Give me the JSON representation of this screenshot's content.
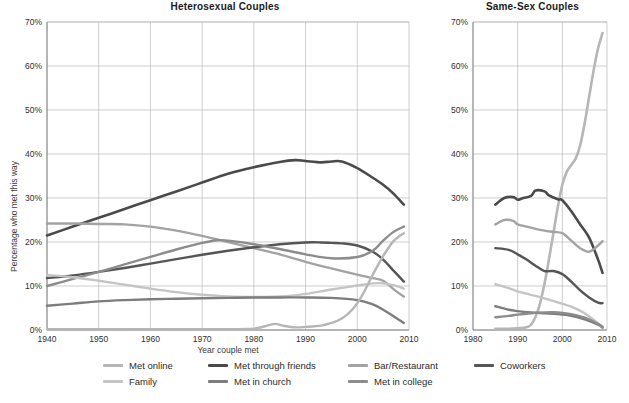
{
  "figure": {
    "x_axis_title": "Year couple met",
    "y_axis_title": "Percentage who met this way"
  },
  "panels": {
    "heterosexual": {
      "title": "Heterosexual Couples"
    },
    "same_sex": {
      "title": "Same-Sex Couples"
    }
  },
  "legend": {
    "rows": [
      [
        {
          "label": "Met online",
          "color": "#b6b6b6",
          "key": "met_online"
        },
        {
          "label": "Met through friends",
          "color": "#4a4a4a",
          "key": "met_through_friends"
        },
        {
          "label": "Bar/Restaurant",
          "color": "#a3a3a3",
          "key": "bar_restaurant"
        },
        {
          "label": "Coworkers",
          "color": "#555555",
          "key": "coworkers"
        }
      ],
      [
        {
          "label": "Family",
          "color": "#c4c4c4",
          "key": "family"
        },
        {
          "label": "Met in church",
          "color": "#7d7d7d",
          "key": "met_in_church"
        },
        {
          "label": "Met in college",
          "color": "#8c8c8c",
          "key": "met_in_college"
        }
      ]
    ]
  },
  "chart_data": [
    {
      "id": "heterosexual",
      "type": "line",
      "title": "Heterosexual Couples",
      "xlabel": "Year couple met",
      "ylabel": "Percentage who met this way",
      "xlim": [
        1940,
        2010
      ],
      "ylim": [
        0,
        70
      ],
      "xticks": [
        1940,
        1950,
        1960,
        1970,
        1980,
        1990,
        2000,
        2010
      ],
      "xticklabels": [
        "1940",
        "1950",
        "1960",
        "1970",
        "1980",
        "1990",
        "2000",
        "2010"
      ],
      "yticks": [
        0,
        10,
        20,
        30,
        40,
        50,
        60,
        70
      ],
      "yticklabels": [
        "0%",
        "10%",
        "20%",
        "30%",
        "40%",
        "50%",
        "60%",
        "70%"
      ],
      "grid": true,
      "legend_position": "below-figure",
      "series": [
        {
          "name": "Met through friends",
          "color": "#4a4a4a",
          "width": 2.6,
          "x": [
            1940,
            1945,
            1950,
            1955,
            1960,
            1965,
            1970,
            1975,
            1980,
            1985,
            1988,
            1990,
            1993,
            1995,
            1997,
            2000,
            2003,
            2005,
            2007,
            2009
          ],
          "y": [
            21.5,
            23.5,
            25.5,
            27.5,
            29.5,
            31.5,
            33.5,
            35.5,
            37.0,
            38.2,
            38.6,
            38.4,
            38.1,
            38.3,
            38.3,
            36.8,
            34.6,
            33.0,
            31.0,
            28.5
          ]
        },
        {
          "name": "Bar/Restaurant",
          "color": "#a3a3a3",
          "width": 2.4,
          "x": [
            1940,
            1945,
            1950,
            1955,
            1960,
            1965,
            1970,
            1975,
            1980,
            1985,
            1990,
            1995,
            2000,
            2003,
            2005,
            2007,
            2009
          ],
          "y": [
            24.2,
            24.2,
            24.1,
            24.0,
            23.5,
            22.6,
            21.4,
            20.0,
            18.6,
            17.2,
            15.5,
            14.0,
            12.6,
            11.8,
            11.2,
            9.3,
            7.6
          ]
        },
        {
          "name": "Coworkers",
          "color": "#555555",
          "width": 2.4,
          "x": [
            1940,
            1945,
            1950,
            1955,
            1960,
            1965,
            1970,
            1975,
            1980,
            1985,
            1990,
            1993,
            1995,
            1997,
            2000,
            2003,
            2005,
            2007,
            2009
          ],
          "y": [
            11.8,
            12.4,
            13.2,
            14.1,
            15.1,
            16.1,
            17.1,
            18.0,
            18.8,
            19.5,
            19.9,
            19.9,
            19.8,
            19.7,
            19.2,
            17.8,
            16.0,
            13.5,
            11.0
          ]
        },
        {
          "name": "Met in college",
          "color": "#8c8c8c",
          "width": 2.4,
          "x": [
            1940,
            1945,
            1950,
            1955,
            1960,
            1965,
            1970,
            1973,
            1975,
            1980,
            1985,
            1990,
            1995,
            2000,
            2003,
            2005,
            2007,
            2009
          ],
          "y": [
            10.0,
            11.6,
            13.2,
            14.9,
            16.6,
            18.3,
            19.8,
            20.4,
            20.3,
            19.5,
            18.4,
            17.2,
            16.3,
            16.6,
            18.0,
            20.3,
            22.3,
            23.5
          ]
        },
        {
          "name": "Family",
          "color": "#c4c4c4",
          "width": 2.4,
          "x": [
            1940,
            1945,
            1950,
            1955,
            1960,
            1965,
            1970,
            1975,
            1980,
            1985,
            1990,
            1995,
            2000,
            2003,
            2005,
            2007,
            2009
          ],
          "y": [
            12.5,
            12.0,
            11.2,
            10.3,
            9.4,
            8.6,
            8.0,
            7.6,
            7.5,
            7.6,
            8.2,
            9.2,
            10.1,
            10.6,
            10.6,
            10.2,
            9.4
          ]
        },
        {
          "name": "Met in church",
          "color": "#7d7d7d",
          "width": 2.4,
          "x": [
            1940,
            1945,
            1950,
            1955,
            1960,
            1965,
            1970,
            1975,
            1980,
            1985,
            1990,
            1995,
            2000,
            2003,
            2005,
            2007,
            2009
          ],
          "y": [
            5.5,
            6.0,
            6.5,
            6.8,
            7.0,
            7.1,
            7.2,
            7.3,
            7.4,
            7.4,
            7.4,
            7.3,
            6.8,
            5.8,
            4.6,
            3.1,
            1.6
          ]
        },
        {
          "name": "Met online",
          "color": "#b6b6b6",
          "width": 2.4,
          "x": [
            1940,
            1960,
            1975,
            1980,
            1982,
            1984,
            1986,
            1988,
            1990,
            1993,
            1995,
            1997,
            1999,
            2001,
            2003,
            2005,
            2007,
            2009
          ],
          "y": [
            0.2,
            0.2,
            0.2,
            0.3,
            0.8,
            1.4,
            0.9,
            0.6,
            0.7,
            1.0,
            1.6,
            2.6,
            4.6,
            8.0,
            12.6,
            16.8,
            20.2,
            22.0
          ]
        }
      ]
    },
    {
      "id": "same_sex",
      "type": "line",
      "title": "Same-Sex Couples",
      "xlabel": "Year couple met",
      "ylabel": "Percentage who met this way",
      "xlim": [
        1980,
        2010
      ],
      "ylim": [
        0,
        70
      ],
      "xticks": [
        1980,
        1990,
        2000,
        2010
      ],
      "xticklabels": [
        "1980",
        "1990",
        "2000",
        "2010"
      ],
      "yticks": [
        0,
        10,
        20,
        30,
        40,
        50,
        60,
        70
      ],
      "yticklabels": [
        "0%",
        "10%",
        "20%",
        "30%",
        "40%",
        "50%",
        "60%",
        "70%"
      ],
      "grid": true,
      "legend_position": "below-figure",
      "series": [
        {
          "name": "Met online",
          "color": "#b6b6b6",
          "width": 2.6,
          "x": [
            1985,
            1988,
            1990,
            1992,
            1993,
            1994,
            1995,
            1996,
            1997,
            1998,
            1999,
            2000,
            2001,
            2002,
            2003,
            2004,
            2005,
            2006,
            2007,
            2008,
            2009
          ],
          "y": [
            0.3,
            0.3,
            0.4,
            0.6,
            1.2,
            3.0,
            6.0,
            10.5,
            16.0,
            22.0,
            28.0,
            33.0,
            36.0,
            37.5,
            39.0,
            42.0,
            47.0,
            53.0,
            59.0,
            64.0,
            67.5
          ]
        },
        {
          "name": "Met through friends",
          "color": "#4a4a4a",
          "width": 2.6,
          "x": [
            1985,
            1987,
            1989,
            1990,
            1991,
            1993,
            1994,
            1996,
            1997,
            1999,
            2000,
            2002,
            2004,
            2006,
            2008,
            2009
          ],
          "y": [
            28.5,
            30.0,
            30.2,
            29.6,
            29.9,
            30.5,
            31.7,
            31.5,
            30.6,
            29.7,
            29.5,
            27.0,
            24.0,
            21.0,
            16.0,
            13.0
          ]
        },
        {
          "name": "Bar/Restaurant",
          "color": "#a3a3a3",
          "width": 2.4,
          "x": [
            1985,
            1987,
            1989,
            1990,
            1992,
            1994,
            1996,
            1998,
            2000,
            2002,
            2004,
            2006,
            2008,
            2009
          ],
          "y": [
            24.0,
            25.0,
            24.8,
            24.0,
            23.5,
            23.0,
            22.6,
            22.3,
            22.0,
            20.3,
            18.6,
            17.8,
            19.2,
            20.2
          ]
        },
        {
          "name": "Coworkers",
          "color": "#555555",
          "width": 2.4,
          "x": [
            1985,
            1988,
            1990,
            1992,
            1994,
            1996,
            1998,
            2000,
            2002,
            2004,
            2006,
            2008,
            2009
          ],
          "y": [
            18.6,
            18.2,
            17.2,
            16.0,
            14.6,
            13.4,
            13.4,
            12.7,
            11.0,
            9.0,
            7.4,
            6.2,
            6.1
          ]
        },
        {
          "name": "Family",
          "color": "#c4c4c4",
          "width": 2.4,
          "x": [
            1985,
            1988,
            1990,
            1993,
            1996,
            1999,
            2002,
            2005,
            2008,
            2009
          ],
          "y": [
            10.4,
            9.5,
            8.8,
            8.0,
            7.2,
            6.3,
            5.3,
            3.8,
            1.5,
            0.8
          ]
        },
        {
          "name": "Met in church",
          "color": "#7d7d7d",
          "width": 2.4,
          "x": [
            1985,
            1988,
            1990,
            1993,
            1996,
            1999,
            2002,
            2005,
            2008,
            2009
          ],
          "y": [
            5.4,
            4.6,
            4.3,
            4.0,
            3.8,
            3.6,
            3.2,
            2.4,
            1.2,
            0.6
          ]
        },
        {
          "name": "Met in college",
          "color": "#8c8c8c",
          "width": 2.4,
          "x": [
            1985,
            1988,
            1990,
            1993,
            1996,
            1999,
            2002,
            2005,
            2008,
            2009
          ],
          "y": [
            2.9,
            3.2,
            3.5,
            3.8,
            4.0,
            4.0,
            3.6,
            2.8,
            1.4,
            0.5
          ]
        }
      ]
    }
  ]
}
